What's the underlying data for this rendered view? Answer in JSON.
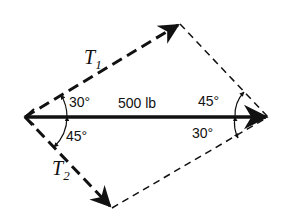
{
  "diagram": {
    "type": "force-parallelogram",
    "resultant": {
      "label": "500 lb"
    },
    "vectors": [
      {
        "name": "T",
        "subscript": "1"
      },
      {
        "name": "T",
        "subscript": "2"
      }
    ],
    "angles": {
      "left_upper": "30°",
      "left_lower": "45°",
      "right_upper": "45°",
      "right_lower": "30°"
    }
  }
}
